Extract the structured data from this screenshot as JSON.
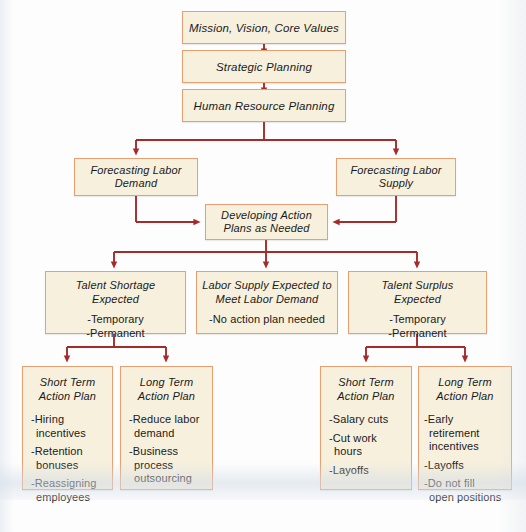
{
  "diagram": {
    "type": "flowchart",
    "colors": {
      "node_fill": "#f7f0dd",
      "node_border": "#e8a072",
      "connector": "#a52a2a",
      "page_background": "#fdfdfd",
      "text": "#1a1a1a"
    },
    "nodes": {
      "mission": {
        "title": "Mission, Vision, Core Values"
      },
      "strategic_planning": {
        "title": "Strategic Planning"
      },
      "hr_planning": {
        "title": "Human Resource Planning"
      },
      "forecast_demand": {
        "title": "Forecasting Labor\nDemand"
      },
      "forecast_supply": {
        "title": "Forecasting Labor\nSupply"
      },
      "developing_action_plans": {
        "title": "Developing Action\nPlans as Needed"
      },
      "talent_shortage": {
        "title": "Talent Shortage\nExpected",
        "bullets": [
          "-Temporary",
          "-Permanent"
        ]
      },
      "supply_meets_demand": {
        "title": "Labor Supply Expected to\nMeet Labor Demand",
        "bullets": [
          "-No action plan needed"
        ]
      },
      "talent_surplus": {
        "title": "Talent Surplus\nExpected",
        "bullets": [
          "-Temporary",
          "-Permanent"
        ]
      },
      "shortage_short_term": {
        "title": "Short Term\nAction Plan",
        "bullets": [
          "-Hiring\n incentives",
          "-Retention\n bonuses",
          "-Reassigning\n employees"
        ]
      },
      "shortage_long_term": {
        "title": "Long Term\nAction Plan",
        "bullets": [
          "-Reduce labor\n demand",
          "-Business\n process\n outsourcing"
        ]
      },
      "surplus_short_term": {
        "title": "Short Term\nAction Plan",
        "bullets": [
          "-Salary cuts",
          "-Cut work\n hours",
          "-Layoffs"
        ]
      },
      "surplus_long_term": {
        "title": "Long Term\nAction Plan",
        "bullets": [
          "-Early\n retirement\n incentives",
          "-Layoffs",
          "-Do not fill\nopen positions"
        ]
      }
    }
  }
}
